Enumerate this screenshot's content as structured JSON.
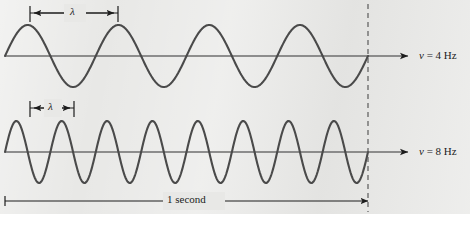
{
  "figure": {
    "background_color": "#e8e8e6",
    "page_color": "#ffffff",
    "wave_color": "#4a4a4a",
    "axis_color": "#6e6e6e",
    "annotation_color": "#1c1c1c"
  },
  "waves": [
    {
      "id": "upper",
      "frequency_label": "= 4 Hz",
      "nu_symbol": "ν",
      "cycles": 4,
      "wavelength_label": "λ",
      "axis_y": 56,
      "amplitude": 31
    },
    {
      "id": "lower",
      "frequency_label": "= 8 Hz",
      "nu_symbol": "ν",
      "cycles": 8,
      "wavelength_label": "λ",
      "axis_y": 152,
      "amplitude": 31
    }
  ],
  "time_span": {
    "label": "1 second",
    "start_x": 5,
    "end_x": 368
  },
  "marker_line": {
    "name": "one-second-marker",
    "x": 368,
    "style": "dashed"
  },
  "chart_data": {
    "type": "line",
    "title": "",
    "xlabel": "",
    "ylabel": "",
    "xlim": [
      0,
      1
    ],
    "ylim": [
      -1,
      1
    ],
    "grid": false,
    "legend": "right",
    "annotations": [
      "λ",
      "λ",
      "1 second",
      "ν = 4 Hz",
      "ν = 8 Hz"
    ],
    "series": [
      {
        "name": "ν = 4 Hz",
        "frequency_hz": 4,
        "amplitude": 1,
        "cycles_in_one_second": 4,
        "wavelength_fraction_of_span": 0.25
      },
      {
        "name": "ν = 8 Hz",
        "frequency_hz": 8,
        "amplitude": 1,
        "cycles_in_one_second": 8,
        "wavelength_fraction_of_span": 0.125
      }
    ]
  },
  "footer": {
    "clipped_text": ""
  }
}
